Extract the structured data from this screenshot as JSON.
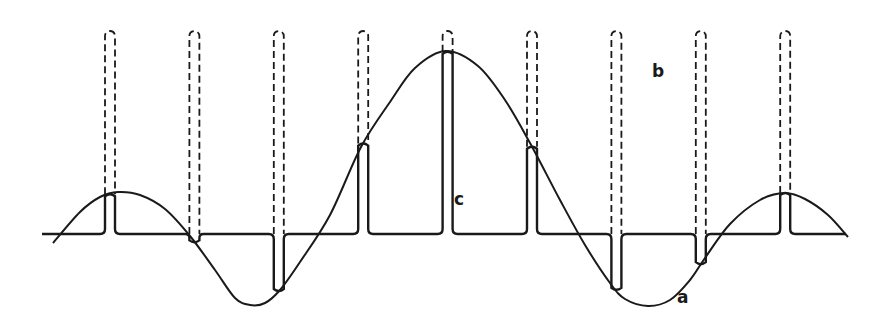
{
  "figure": {
    "labels": {
      "a": "a",
      "b": "b",
      "c": "c"
    },
    "legend_meaning": {
      "a": "continuous waveform",
      "b": "unmodulated pulse train (dashed)",
      "c": "amplitude-modulated sample pulses"
    },
    "pulse_count": 9,
    "colors": {
      "ink": "#1a1a1a",
      "background": "#ffffff"
    }
  }
}
